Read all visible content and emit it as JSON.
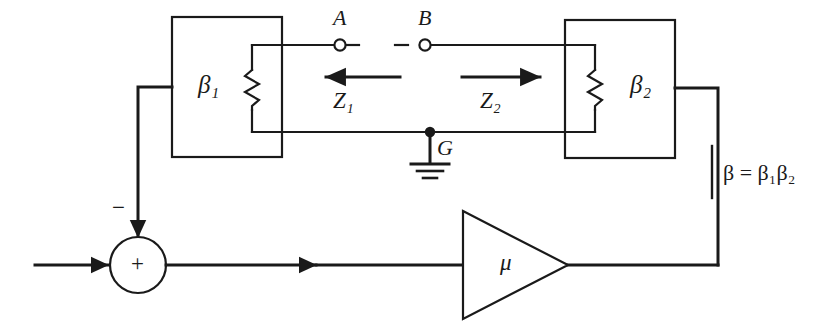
{
  "diagram": {
    "blocks": {
      "beta1_label": "β₁",
      "beta2_label": "β₂",
      "amplifier_label": "μ"
    },
    "terminals": {
      "a_label": "A",
      "b_label": "B",
      "ground_label": "G"
    },
    "impedances": {
      "z1_label": "Z₁",
      "z2_label": "Z₂",
      "z1_arrow_direction": "left",
      "z2_arrow_direction": "right"
    },
    "summing_junction": {
      "plus_label": "+",
      "minus_label": "−"
    },
    "equation": {
      "beta_product": "β = β₁β₂"
    },
    "colors": {
      "line": "#1a1a1a",
      "background": "#ffffff",
      "text": "#1a1a1a"
    }
  }
}
